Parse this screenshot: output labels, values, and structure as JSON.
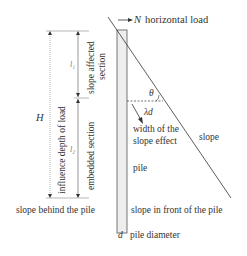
{
  "diagram": {
    "labels": {
      "load_symbol": "N",
      "load_text": "horizontal load",
      "H": "H",
      "l1": "l₁",
      "l2": "l₂",
      "influence_depth": "influence depth of load",
      "slope_affected": "slope affected",
      "section": "section",
      "embedded_section": "embedded section",
      "theta": "θ",
      "lambda_d": "λd",
      "width_line1": "width of the",
      "width_line2": "slope effect",
      "slope": "slope",
      "pile": "pile",
      "slope_behind": "slope behind the pile",
      "slope_front": "slope in front of the pile",
      "d_symbol": "d",
      "d_text": "pile diameter"
    },
    "colors": {
      "line": "#333333",
      "pile_fill": "#eeeeee",
      "pile_stroke": "#555555",
      "dotted": "#888888"
    }
  }
}
